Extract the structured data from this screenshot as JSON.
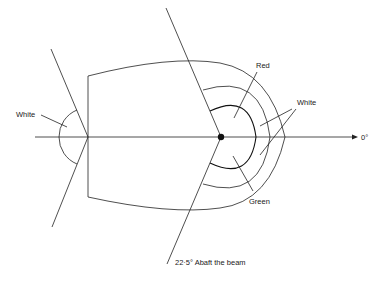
{
  "diagram": {
    "labels": {
      "red": "Red",
      "green": "Green",
      "white_forward": "White",
      "white_stern": "White",
      "zero": "0°",
      "abaft": "22·5° Abaft the beam"
    },
    "colors": {
      "line": "#222222",
      "background": "#ffffff"
    }
  }
}
